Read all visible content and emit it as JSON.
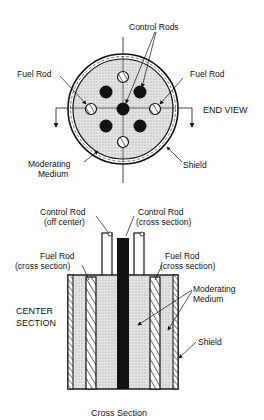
{
  "end_view": {
    "title": "END VIEW",
    "labels": {
      "control_rods": "Control Rods",
      "fuel_rod_left": "Fuel Rod",
      "fuel_rod_right": "Fuel Rod",
      "moderating_medium_1": "Moderating",
      "moderating_medium_2": "Medium",
      "shield": "Shield"
    }
  },
  "cross_section": {
    "title_1": "CENTER",
    "title_2": "SECTION",
    "caption": "Cross Section",
    "labels": {
      "control_rod_off_1": "Control Rod",
      "control_rod_off_2": "(off center)",
      "control_rod_cross_1": "Control Rod",
      "control_rod_cross_2": "(cross section)",
      "fuel_rod_left_1": "Fuel Rod",
      "fuel_rod_left_2": "(cross section)",
      "fuel_rod_right_1": "Fuel Rod",
      "fuel_rod_right_2": "(cross section)",
      "moderating_medium_1": "Moderating",
      "moderating_medium_2": "Medium",
      "shield": "Shield"
    }
  },
  "colors": {
    "ink": "#111111",
    "medium_fill": "#d8d8d8",
    "background": "#ffffff"
  }
}
